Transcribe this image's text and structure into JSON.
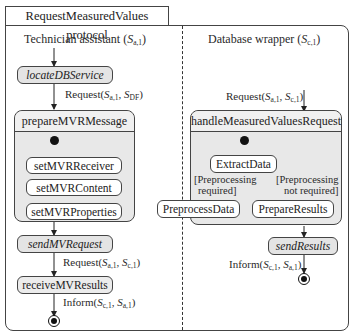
{
  "diagram": {
    "title": "RequestMeasuredValues protocol",
    "lanes": [
      {
        "name": "Technician assistant",
        "role": "S",
        "role_sub": "a,1"
      },
      {
        "name": "Database wrapper",
        "role": "S",
        "role_sub": "c,1"
      }
    ],
    "left": {
      "locate": "locateDBService",
      "msg1": {
        "label": "Request(",
        "a": "S",
        "a_sub": "a,1",
        "b": "S",
        "b_sub": "DF",
        "close": ")"
      },
      "prepare": {
        "title": "prepareMVRMessage",
        "steps": [
          "setMVRReceiver",
          "setMVRContent",
          "setMVRProperties"
        ]
      },
      "send": "sendMVRequest",
      "msg2": {
        "label": "Request(",
        "a": "S",
        "a_sub": "a,1",
        "b": "S",
        "b_sub": "c,1",
        "close": ")"
      },
      "receive": "receiveMVResults",
      "msg3": {
        "label": "Inform(",
        "a": "S",
        "a_sub": "c,1",
        "b": "S",
        "b_sub": "a,1",
        "close": ")"
      }
    },
    "right": {
      "msg_in": {
        "label": "Request(",
        "a": "S",
        "a_sub": "a,1",
        "b": "S",
        "b_sub": "c,1",
        "close": ")"
      },
      "handle": {
        "title": "handleMeasuredValuesRequest",
        "extract": "ExtractData",
        "guard_left": [
          "[Preprocessing",
          "required]"
        ],
        "guard_right": [
          "[Preprocessing",
          "not required]"
        ],
        "preprocess": "PreprocessData",
        "prepare_results": "PrepareResults"
      },
      "send": "sendResults",
      "msg_out": {
        "label": "Inform(",
        "a": "S",
        "a_sub": "c,1",
        "b": "S",
        "b_sub": "a,1",
        "close": ")"
      }
    }
  }
}
